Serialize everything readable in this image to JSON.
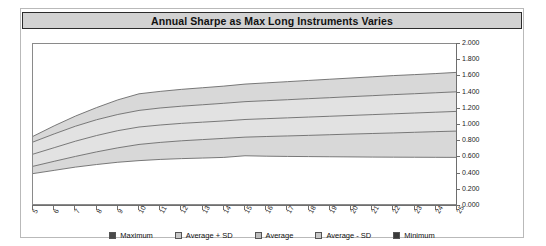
{
  "title": "Annual Sharpe as Max Long Instruments Varies",
  "colors": {
    "band_outer": "#d8d8d8",
    "band_inner": "#e2e2e2",
    "line": "#6b6b6b",
    "title_bar": "#d2d2d2",
    "frame": "#b9b9b9",
    "axis": "#6e6e6e",
    "legend_maximum": "#4a4a4a",
    "legend_avg_plus_sd": "#c8c8c8",
    "legend_average": "#bdbdbd",
    "legend_avg_minus_sd": "#c8c8c8",
    "legend_minimum": "#3a3a3a"
  },
  "legend": {
    "position": "bottom",
    "items": [
      {
        "label": "Maximum",
        "color": "#4a4a4a"
      },
      {
        "label": "Average + SD",
        "color": "#c8c8c8"
      },
      {
        "label": "Average",
        "color": "#bdbdbd"
      },
      {
        "label": "Average - SD",
        "color": "#c8c8c8"
      },
      {
        "label": "Minimum",
        "color": "#3a3a3a"
      }
    ]
  },
  "chart_data": {
    "type": "area",
    "title": "Annual Sharpe as Max Long Instruments Varies",
    "xlabel": "",
    "ylabel": "",
    "grid": false,
    "xlim": [
      5,
      25
    ],
    "ylim": [
      0.0,
      2.0
    ],
    "y_ticks": [
      "0.000",
      "0.200",
      "0.400",
      "0.600",
      "0.800",
      "1.000",
      "1.200",
      "1.400",
      "1.600",
      "1.800",
      "2.000"
    ],
    "y_tick_values": [
      0.0,
      0.2,
      0.4,
      0.6,
      0.8,
      1.0,
      1.2,
      1.4,
      1.6,
      1.8,
      2.0
    ],
    "x": [
      5,
      6,
      7,
      8,
      9,
      10,
      11,
      12,
      13,
      14,
      15,
      16,
      17,
      18,
      19,
      20,
      21,
      22,
      23,
      24,
      25
    ],
    "x_tick_labels": [
      "5",
      "6",
      "7",
      "8",
      "9",
      "10",
      "11",
      "12",
      "13",
      "14",
      "15",
      "16",
      "17",
      "18",
      "19",
      "20",
      "21",
      "22",
      "23",
      "24",
      "25"
    ],
    "series": [
      {
        "name": "Maximum",
        "values": [
          0.86,
          0.99,
          1.11,
          1.215,
          1.31,
          1.385,
          1.415,
          1.44,
          1.46,
          1.48,
          1.505,
          1.52,
          1.535,
          1.55,
          1.565,
          1.58,
          1.595,
          1.61,
          1.622,
          1.635,
          1.65
        ]
      },
      {
        "name": "Average + SD",
        "values": [
          0.79,
          0.89,
          0.985,
          1.065,
          1.13,
          1.18,
          1.21,
          1.232,
          1.25,
          1.268,
          1.288,
          1.3,
          1.312,
          1.325,
          1.337,
          1.35,
          1.362,
          1.375,
          1.386,
          1.398,
          1.41
        ]
      },
      {
        "name": "Average",
        "values": [
          0.64,
          0.72,
          0.8,
          0.87,
          0.93,
          0.975,
          1.0,
          1.02,
          1.035,
          1.05,
          1.068,
          1.078,
          1.088,
          1.098,
          1.108,
          1.118,
          1.128,
          1.138,
          1.148,
          1.158,
          1.168
        ]
      },
      {
        "name": "Average - SD",
        "values": [
          0.49,
          0.552,
          0.612,
          0.668,
          0.718,
          0.76,
          0.785,
          0.805,
          0.82,
          0.835,
          0.85,
          0.858,
          0.865,
          0.872,
          0.88,
          0.888,
          0.895,
          0.902,
          0.91,
          0.918,
          0.925
        ]
      },
      {
        "name": "Minimum",
        "values": [
          0.4,
          0.44,
          0.48,
          0.512,
          0.54,
          0.56,
          0.575,
          0.585,
          0.592,
          0.6,
          0.62,
          0.615,
          0.612,
          0.61,
          0.608,
          0.606,
          0.604,
          0.603,
          0.602,
          0.601,
          0.6
        ]
      }
    ]
  }
}
